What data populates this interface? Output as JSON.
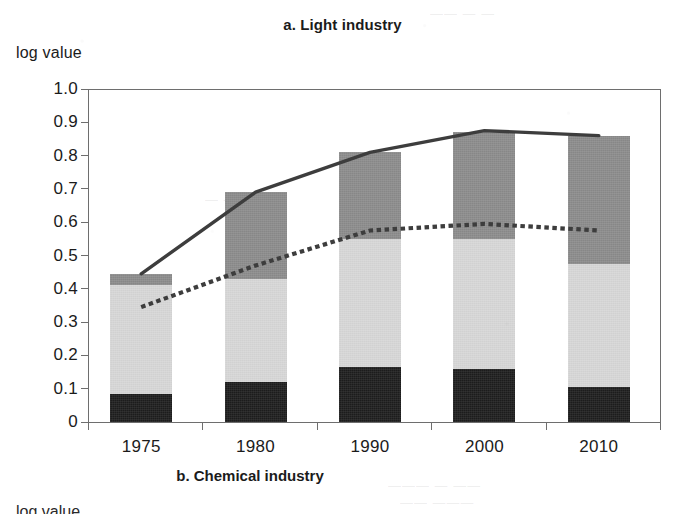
{
  "figure": {
    "panel_a_title": "a. Light industry",
    "panel_a_axis_caption": "log value",
    "panel_b_title": "b. Chemical industry",
    "panel_b_axis_caption": "log value"
  },
  "colors": {
    "segment_bottom": "#1d1d1d",
    "segment_middle": "#d7d7d7",
    "segment_top": "#8b8b8b",
    "solid_line": "#3d3d3d",
    "dotted_line": "#3d3d3d",
    "axis": "#6e6e6e",
    "text": "#1b1b1b",
    "background": "#ffffff"
  },
  "ghost_marks": [
    {
      "text": "—— — —",
      "left": 430,
      "top": 6
    },
    {
      "text": "— ——",
      "left": 205,
      "top": 192
    },
    {
      "text": "——— — ——",
      "left": 388,
      "top": 478
    },
    {
      "text": "—— ———",
      "left": 400,
      "top": 495
    }
  ],
  "chart_data": {
    "type": "bar",
    "title": "a. Light industry",
    "xlabel": "",
    "ylabel": "log value",
    "ylim": [
      0,
      1.0
    ],
    "yticks": [
      0,
      0.1,
      0.2,
      0.3,
      0.4,
      0.5,
      0.6,
      0.7,
      0.8,
      0.9,
      1.0
    ],
    "ytick_labels": [
      "0",
      "0.1",
      "0.2",
      "0.3",
      "0.4",
      "0.5",
      "0.6",
      "0.7",
      "0.8",
      "0.9",
      "1.0"
    ],
    "grid": false,
    "legend": "none",
    "categories": [
      "1975",
      "1980",
      "1990",
      "2000",
      "2010"
    ],
    "stacked": true,
    "series": [
      {
        "name": "bottom-segment",
        "color": "#1d1d1d",
        "values": [
          0.085,
          0.12,
          0.165,
          0.16,
          0.105
        ]
      },
      {
        "name": "middle-segment",
        "color": "#d7d7d7",
        "values": [
          0.325,
          0.31,
          0.385,
          0.39,
          0.37
        ]
      },
      {
        "name": "top-segment",
        "color": "#8b8b8b",
        "values": [
          0.035,
          0.26,
          0.26,
          0.32,
          0.385
        ]
      }
    ],
    "cumulative_tops": [
      0.445,
      0.69,
      0.81,
      0.87,
      0.86
    ],
    "cumulative_mid_tops": [
      0.41,
      0.43,
      0.55,
      0.55,
      0.475
    ],
    "overlay_lines": [
      {
        "name": "solid-line",
        "style": "solid",
        "color": "#3d3d3d",
        "x": [
          "1975",
          "1980",
          "1990",
          "2000",
          "2010"
        ],
        "values": [
          0.445,
          0.69,
          0.81,
          0.875,
          0.86
        ]
      },
      {
        "name": "dotted-line",
        "style": "dotted",
        "color": "#3d3d3d",
        "x": [
          "1975",
          "1980",
          "1990",
          "2000",
          "2010"
        ],
        "values": [
          0.345,
          0.47,
          0.575,
          0.595,
          0.575
        ]
      }
    ]
  }
}
